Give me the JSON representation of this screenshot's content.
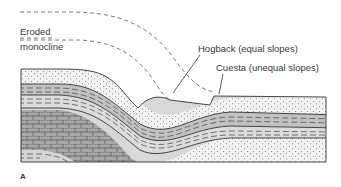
{
  "figure": {
    "panel_label": "A",
    "labels": {
      "eroded": "Eroded",
      "monocline": "monocline",
      "hogback": "Hogback (equal slopes)",
      "cuesta": "Cuesta (unequal slopes)"
    },
    "colors": {
      "sandstone": "#f1f1f1",
      "shale_light": "#d9d9d9",
      "shale_dark": "#b9b9b9",
      "limestone": "#a9a9a9",
      "line": "#333333"
    }
  }
}
